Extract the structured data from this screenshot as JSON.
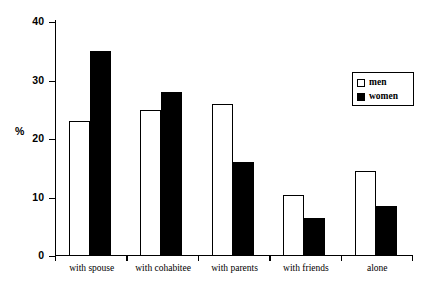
{
  "chart_data": {
    "type": "bar",
    "title": "",
    "xlabel": "",
    "ylabel": "%",
    "ylim": [
      0,
      40
    ],
    "yticks": [
      0,
      10,
      20,
      30,
      40
    ],
    "ytick_labels": [
      "0",
      "10",
      "20",
      "30",
      "40"
    ],
    "grid": false,
    "legend_position": "top-right",
    "categories": [
      "with spouse",
      "with cohabitee",
      "with parents",
      "with friends",
      "alone"
    ],
    "series": [
      {
        "name": "men",
        "marker": "hollow-square",
        "color": "#ffffff",
        "edge_color": "#000000",
        "values": [
          23,
          25,
          26,
          10.5,
          14.5
        ]
      },
      {
        "name": "women",
        "marker": "filled-square",
        "color": "#000000",
        "edge_color": "#000000",
        "values": [
          35,
          28,
          16,
          6.5,
          8.5
        ]
      }
    ]
  },
  "legend": {
    "items": [
      {
        "label": "men"
      },
      {
        "label": "women"
      }
    ]
  },
  "axis": {
    "y_label": "%"
  }
}
